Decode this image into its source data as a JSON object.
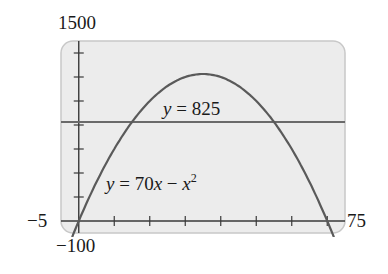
{
  "chart_data": {
    "type": "line",
    "title": "",
    "xlabel": "",
    "ylabel": "",
    "xlim": [
      -5,
      75
    ],
    "ylim": [
      -100,
      1500
    ],
    "grid": false,
    "legend": null,
    "x_ticks": [
      0,
      10,
      20,
      30,
      40,
      50,
      60,
      70
    ],
    "y_ticks": [
      0,
      200,
      400,
      600,
      800,
      1000,
      1200,
      1400
    ],
    "window_labels": {
      "ymax": "1500",
      "xmin": "−5",
      "ymin": "−100",
      "xmax": "75"
    },
    "series": [
      {
        "name": "y = 70x − x²",
        "kind": "function",
        "expression": "70x - x^2",
        "x": [
          -5,
          0,
          10,
          15,
          20,
          30,
          35,
          40,
          50,
          55,
          60,
          70,
          75
        ],
        "y": [
          -375,
          0,
          600,
          825,
          1000,
          1200,
          1225,
          1200,
          1000,
          825,
          600,
          0,
          -375
        ],
        "color": "#5a5a5a"
      },
      {
        "name": "y = 825",
        "kind": "horizontal-line",
        "expression": "825",
        "x": [
          -5,
          75
        ],
        "y": [
          825,
          825
        ],
        "color": "#6a6a6a"
      }
    ],
    "annotations": [
      {
        "text": "y = 825",
        "x": 33,
        "y": 900
      },
      {
        "text": "y = 70x − x²",
        "x": 22,
        "y": 300
      }
    ],
    "intersections": [
      [
        15,
        825
      ],
      [
        55,
        825
      ]
    ]
  },
  "labels": {
    "ymax": "1500",
    "xmin": "−5",
    "ymin": "−100",
    "xmax": "75",
    "eq_line": {
      "y": "y",
      "eq": " = 825"
    },
    "eq_curve": {
      "y": "y",
      "eq": " = 70",
      "x1": "x",
      "minus": " − ",
      "x2": "x",
      "exp": "2"
    }
  },
  "colors": {
    "frame_fill": "#ececec",
    "frame_border": "#c8c8c8",
    "axis": "#3a3a3a",
    "curve": "#5a5a5a",
    "line": "#6a6a6a"
  }
}
